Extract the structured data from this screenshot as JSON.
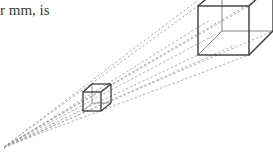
{
  "caption": {
    "text": "r mm, is"
  },
  "diagram": {
    "colors": {
      "edges": "#3a3a3a",
      "rays": "#9a9a9a"
    },
    "small_cube": {
      "front": [
        83,
        92,
        101,
        111
      ],
      "offset": [
        9,
        -8
      ]
    },
    "large_cube": {
      "front": [
        198,
        6,
        249,
        55
      ],
      "offset": [
        24,
        -24
      ]
    },
    "origin": [
      2,
      148
    ]
  }
}
